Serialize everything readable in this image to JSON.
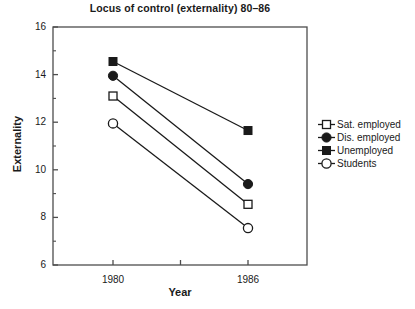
{
  "chart_data": {
    "type": "line",
    "title": "Locus of control (externality) 80–86",
    "xlabel": "Year",
    "ylabel": "Externality",
    "x": [
      "1980",
      "1986"
    ],
    "categories": [
      "1980",
      "1986"
    ],
    "xlim": [
      1978,
      1988
    ],
    "ylim": [
      6,
      16
    ],
    "ytick_labels": [
      "16",
      "14",
      "12",
      "10",
      "8",
      "6"
    ],
    "ytick_values": [
      16,
      14,
      12,
      10,
      8,
      6
    ],
    "yminor_values": [
      15,
      13,
      11,
      9,
      7
    ],
    "xtick_labels": [
      "1980",
      "1986"
    ],
    "grid": false,
    "legend_position": "right",
    "series": [
      {
        "name": "Sat. employed",
        "marker": "open-square",
        "values": [
          13.1,
          8.55
        ]
      },
      {
        "name": "Dis. employed",
        "marker": "filled-circle",
        "values": [
          13.95,
          9.4
        ]
      },
      {
        "name": "Unemployed",
        "marker": "filled-square",
        "values": [
          14.55,
          11.65
        ]
      },
      {
        "name": "Students",
        "marker": "open-circle",
        "values": [
          11.95,
          7.55
        ]
      }
    ]
  },
  "legend": {
    "items": [
      {
        "label": "Sat. employed",
        "marker": "open-square"
      },
      {
        "label": "Dis. employed",
        "marker": "filled-circle"
      },
      {
        "label": "Unemployed",
        "marker": "filled-square"
      },
      {
        "label": "Students",
        "marker": "open-circle"
      }
    ]
  },
  "axes": {
    "y_labels": [
      "16",
      "14",
      "12",
      "10",
      "8",
      "6"
    ],
    "x_labels": [
      "1980",
      "1986"
    ]
  },
  "colors": {
    "line": "#1a1a1a",
    "axis": "#4d4d4d",
    "text": "#1a1a1a",
    "background": "#ffffff"
  }
}
